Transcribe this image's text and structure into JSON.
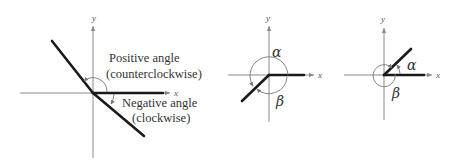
{
  "diagrams": [
    {
      "name": "positive-negative-angles",
      "axis_labels": {
        "x": "x",
        "y": "y"
      },
      "positive_label": {
        "line1": "Positive angle",
        "line2": "(counterclockwise)"
      },
      "negative_label": {
        "line1": "Negative angle",
        "line2": "(clockwise)"
      }
    },
    {
      "name": "coterminal-angles-third-quadrant",
      "axis_labels": {
        "x": "x",
        "y": "y"
      },
      "alpha": "α",
      "beta": "β"
    },
    {
      "name": "coterminal-angles-first-quadrant",
      "axis_labels": {
        "x": "x",
        "y": "y"
      },
      "alpha": "α",
      "beta": "β"
    }
  ],
  "colors": {
    "axis": "#8a8a8a",
    "ray": "#1a1a1a",
    "arc": "#777777",
    "text": "#333333"
  }
}
